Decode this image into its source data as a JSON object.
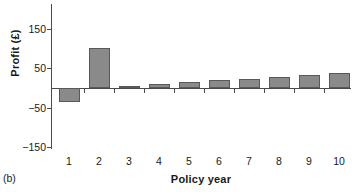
{
  "figure": {
    "panel_label": "(b)",
    "background_color": "#ffffff",
    "bar_fill_color": "#8a8a8a",
    "bar_border_color": "#595959",
    "axis_color": "#4a4a4a"
  },
  "chart_data": {
    "type": "bar",
    "title": "",
    "xlabel": "Policy year",
    "ylabel": "Profit (£)",
    "categories": [
      "1",
      "2",
      "3",
      "4",
      "5",
      "6",
      "7",
      "8",
      "9",
      "10"
    ],
    "values": [
      -35,
      100,
      5,
      10,
      15,
      20,
      23,
      27,
      33,
      38
    ],
    "ylim": [
      -150,
      150
    ],
    "yticks": [
      150,
      50,
      -50,
      -150
    ],
    "ytick_labels": [
      "150",
      "50",
      "−50",
      "−150"
    ],
    "grid": false,
    "legend": "none",
    "zero_line": true
  }
}
